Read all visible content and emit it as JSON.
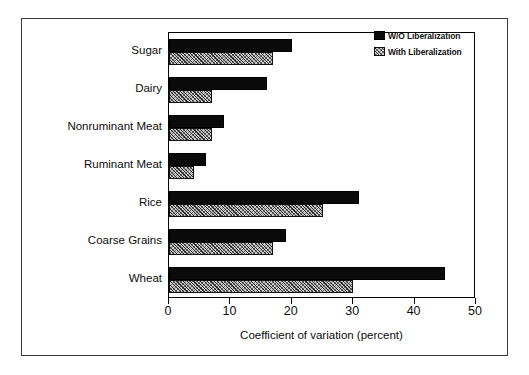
{
  "chart_data": {
    "type": "bar",
    "orientation": "horizontal",
    "title": "",
    "xlabel": "Coefficient of variation (percent)",
    "ylabel": "",
    "xlim": [
      0,
      50
    ],
    "xticks": [
      0,
      10,
      20,
      30,
      40,
      50
    ],
    "xtick_labels": [
      "0",
      "10",
      "20",
      "30",
      "40",
      "50"
    ],
    "grid": false,
    "legend_position": "top-right",
    "categories": [
      "Sugar",
      "Dairy",
      "Nonruminant Meat",
      "Ruminant Meat",
      "Rice",
      "Coarse Grains",
      "Wheat"
    ],
    "series": [
      {
        "name": "W/O Liberalization",
        "style": "solid-black",
        "color": "#0a0a0a",
        "values": [
          20,
          16,
          9,
          6,
          31,
          19,
          45
        ]
      },
      {
        "name": "With Liberalization",
        "style": "hatched-gray",
        "color": "#c9c9c9",
        "values": [
          17,
          7,
          7,
          4,
          25,
          17,
          30
        ]
      }
    ]
  },
  "legend": {
    "items": [
      {
        "label": "W/O Liberalization",
        "swatch": "solid"
      },
      {
        "label": "With Liberalization",
        "swatch": "hatch"
      }
    ]
  },
  "axis": {
    "x_title": "Coefficient of variation (percent)"
  }
}
